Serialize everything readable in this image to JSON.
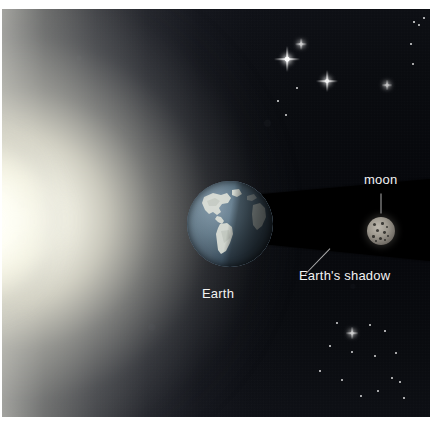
{
  "figure": {
    "type": "astronomy-diagram",
    "background_color": "#0b0d11",
    "frame_color": "#ffffff"
  },
  "labels": {
    "moon": "moon",
    "earth": "Earth",
    "shadow": "Earth's shadow"
  },
  "objects": {
    "sun_glow": {
      "name": "sun-glow",
      "color": "#fffffa",
      "position": "left-edge"
    },
    "earth": {
      "name": "earth",
      "ocean_color": "#5d7585",
      "land_color": "#d9dbd2",
      "diameter_px": 86,
      "center_x": 228,
      "center_y": 224
    },
    "moon": {
      "name": "moon",
      "surface_color": "#9c978d",
      "crater_color": "#141311",
      "diameter_px": 28,
      "center_x": 379,
      "center_y": 222
    },
    "shadow_cone": {
      "name": "earths-shadow-cone",
      "color": "#000000",
      "apex_side": "left",
      "widens_toward": "right"
    }
  },
  "stars": {
    "sparkles": [
      {
        "x": 287,
        "y": 59,
        "size": 26,
        "brightness": 1.0
      },
      {
        "x": 327,
        "y": 81,
        "size": 22,
        "brightness": 0.95
      },
      {
        "x": 301,
        "y": 44,
        "size": 12,
        "brightness": 0.8
      },
      {
        "x": 387,
        "y": 85,
        "size": 11,
        "brightness": 0.75
      },
      {
        "x": 352,
        "y": 333,
        "size": 13,
        "brightness": 0.8
      }
    ],
    "dots": [
      {
        "x": 278,
        "y": 101,
        "r": 1.1
      },
      {
        "x": 286,
        "y": 115,
        "r": 1.0
      },
      {
        "x": 297,
        "y": 88,
        "r": 0.9
      },
      {
        "x": 414,
        "y": 22,
        "r": 1.2
      },
      {
        "x": 419,
        "y": 25,
        "r": 0.9
      },
      {
        "x": 424,
        "y": 18,
        "r": 0.8
      },
      {
        "x": 413,
        "y": 64,
        "r": 1.0
      },
      {
        "x": 411,
        "y": 44,
        "r": 0.8
      },
      {
        "x": 337,
        "y": 323,
        "r": 0.9
      },
      {
        "x": 370,
        "y": 325,
        "r": 1.0
      },
      {
        "x": 385,
        "y": 331,
        "r": 1.1
      },
      {
        "x": 352,
        "y": 352,
        "r": 0.9
      },
      {
        "x": 375,
        "y": 356,
        "r": 1.0
      },
      {
        "x": 396,
        "y": 353,
        "r": 1.0
      },
      {
        "x": 342,
        "y": 380,
        "r": 0.9
      },
      {
        "x": 392,
        "y": 378,
        "r": 1.0
      },
      {
        "x": 400,
        "y": 382,
        "r": 0.8
      },
      {
        "x": 378,
        "y": 391,
        "r": 0.9
      },
      {
        "x": 361,
        "y": 396,
        "r": 0.9
      },
      {
        "x": 404,
        "y": 398,
        "r": 0.8
      },
      {
        "x": 320,
        "y": 371,
        "r": 0.8
      },
      {
        "x": 330,
        "y": 346,
        "r": 0.8
      }
    ]
  }
}
